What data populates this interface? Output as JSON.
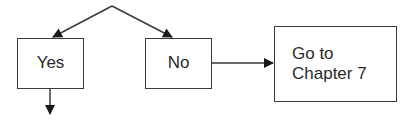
{
  "diagram": {
    "type": "flowchart",
    "nodes": {
      "yes": {
        "label": "Yes"
      },
      "no": {
        "label": "No"
      },
      "chapter": {
        "line1": "Go to",
        "line2": "Chapter 7"
      }
    },
    "edges": [
      {
        "from": "decision-apex",
        "to": "yes"
      },
      {
        "from": "decision-apex",
        "to": "no"
      },
      {
        "from": "no",
        "to": "chapter"
      },
      {
        "from": "yes",
        "to": "continue-below"
      }
    ],
    "colors": {
      "stroke": "#3a3a3a",
      "text": "#2a2a2a",
      "background": "#ffffff"
    }
  }
}
